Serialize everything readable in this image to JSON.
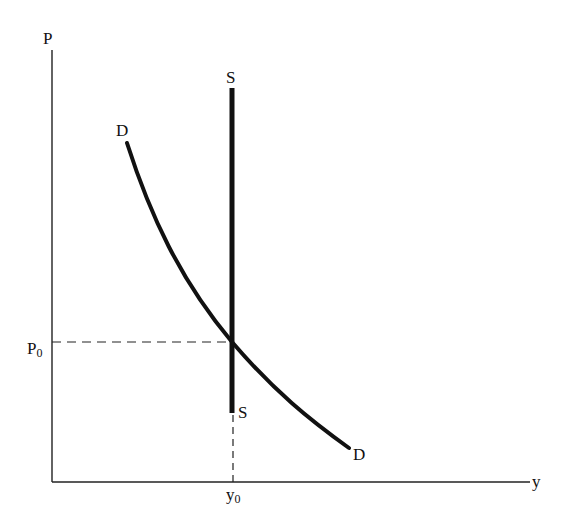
{
  "diagram": {
    "title": "",
    "axes": {
      "y_axis_label": "P",
      "x_axis_label": "y"
    },
    "curves": {
      "supply": {
        "label_top": "S",
        "label_bottom": "S",
        "type": "vertical"
      },
      "demand": {
        "label_start": "D",
        "label_end": "D",
        "type": "downward-sloping"
      }
    },
    "equilibrium": {
      "price_label": "P",
      "price_subscript": "0",
      "quantity_label": "y",
      "quantity_subscript": "0"
    },
    "colors": {
      "line": "#111111",
      "background": "#ffffff"
    }
  }
}
